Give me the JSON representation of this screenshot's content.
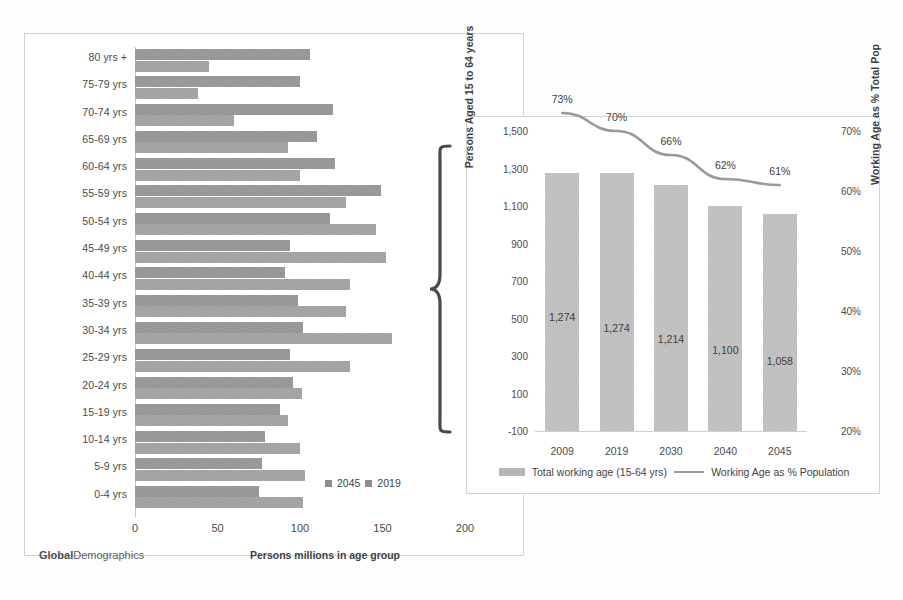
{
  "watermark": {
    "bold": "Global",
    "rest": "Demographics"
  },
  "pyramid": {
    "xlabel": "Persons millions in age group",
    "xticks": [
      "0",
      "50",
      "100",
      "150",
      "200"
    ],
    "legend": [
      {
        "label": "2045"
      },
      {
        "label": "2019"
      }
    ]
  },
  "inset": {
    "ylabel_left": "Persons Aged 15 to 64 years",
    "ylabel_right": "Working Age as % Total Pop",
    "yticks_left": [
      "1,500",
      "1,300",
      "1,100",
      "900",
      "700",
      "500",
      "300",
      "100",
      "-100"
    ],
    "yticks_right": [
      "70%",
      "60%",
      "50%",
      "40%",
      "30%",
      "20%"
    ],
    "legend": [
      {
        "label": "Total working age (15-64 yrs)",
        "marker": "bar-swatch"
      },
      {
        "label": "Working Age as % Population",
        "marker": "line-swatch"
      }
    ]
  },
  "colors": {
    "bar_2045": "#8a8a8a",
    "bar_2019": "#979797",
    "column": "#b6b6b6",
    "line": "#9a9a9a",
    "card_border": "#d2d2d2",
    "text": "#3f3f3f"
  },
  "chart_data": [
    {
      "type": "bar",
      "orientation": "horizontal",
      "title": "",
      "xlabel": "Persons millions in age group",
      "ylabel": "",
      "xlim": [
        0,
        200
      ],
      "xticks": [
        0,
        50,
        100,
        150,
        200
      ],
      "grid": false,
      "legend_position": "bottom-right",
      "categories": [
        "80 yrs +",
        "75-79 yrs",
        "70-74 yrs",
        "65-69 yrs",
        "60-64 yrs",
        "55-59 yrs",
        "50-54 yrs",
        "45-49 yrs",
        "40-44 yrs",
        "35-39 yrs",
        "30-34 yrs",
        "25-29 yrs",
        "20-24 yrs",
        "15-19 yrs",
        "10-14 yrs",
        "5-9 yrs",
        "0-4 yrs"
      ],
      "series": [
        {
          "name": "2045",
          "values": [
            106,
            100,
            120,
            110,
            121,
            149,
            118,
            94,
            91,
            99,
            102,
            94,
            96,
            88,
            79,
            77,
            75
          ]
        },
        {
          "name": "2019",
          "values": [
            45,
            38,
            60,
            93,
            100,
            128,
            146,
            152,
            130,
            128,
            156,
            130,
            101,
            93,
            100,
            103,
            102
          ]
        }
      ]
    },
    {
      "type": "bar",
      "orientation": "vertical",
      "title": "",
      "xlabel": "",
      "ylabel": "Persons Aged 15 to 64 years",
      "ylabel_secondary": "Working Age as % Total Pop",
      "categories": [
        "2009",
        "2019",
        "2030",
        "2040",
        "2045"
      ],
      "ylim": [
        -100,
        1500
      ],
      "yticks": [
        1500,
        1300,
        1100,
        900,
        700,
        500,
        300,
        100,
        -100
      ],
      "ylim_secondary": [
        20,
        70
      ],
      "yticks_secondary": [
        70,
        60,
        50,
        40,
        30,
        20
      ],
      "grid": false,
      "legend_position": "bottom",
      "series": [
        {
          "name": "Total working age (15-64 yrs)",
          "type": "bar",
          "axis": "left",
          "values": [
            1274,
            1274,
            1214,
            1100,
            1058
          ],
          "labels": [
            "1,274",
            "1,274",
            "1,214",
            "1,100",
            "1,058"
          ]
        },
        {
          "name": "Working Age as % Population",
          "type": "line",
          "axis": "right",
          "values": [
            73,
            70,
            66,
            62,
            61
          ],
          "labels": [
            "73%",
            "70%",
            "66%",
            "62%",
            "61%"
          ]
        }
      ]
    }
  ]
}
